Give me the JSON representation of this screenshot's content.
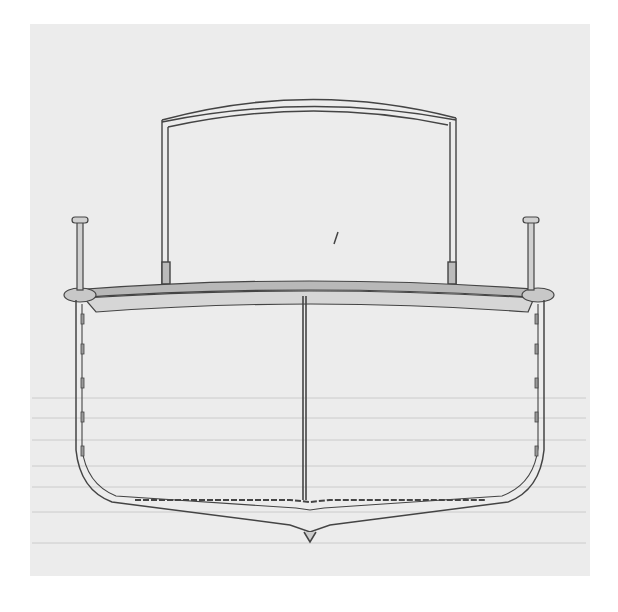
{
  "image": {
    "subject": "ship hull cross-section technical drawing",
    "colors": {
      "paper": "#ececec",
      "margin": "#ffffff",
      "ink": "#444444",
      "fill": "#d8d8d8",
      "waterline": "#bdbdbd"
    }
  }
}
